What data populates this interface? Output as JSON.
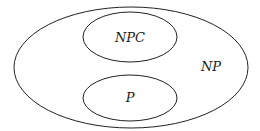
{
  "diagram": {
    "type": "venn",
    "sets": [
      {
        "id": "np",
        "label": "NP",
        "contains": [
          "npc",
          "p"
        ]
      },
      {
        "id": "npc",
        "label": "NPC"
      },
      {
        "id": "p",
        "label": "P"
      }
    ]
  }
}
